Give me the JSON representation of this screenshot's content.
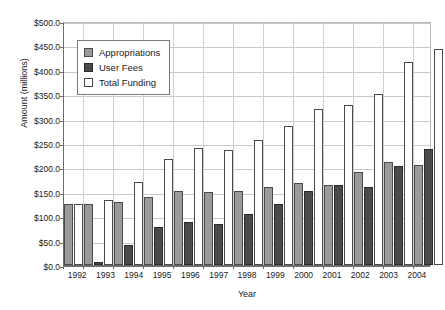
{
  "chart_data": {
    "type": "bar",
    "title": "",
    "xlabel": "Year",
    "ylabel": "Amount (millions)",
    "ylim": [
      0,
      500
    ],
    "ytick_values": [
      0,
      50,
      100,
      150,
      200,
      250,
      300,
      350,
      400,
      450,
      500
    ],
    "ytick_labels": [
      "$0.0",
      "$50.0",
      "$100.0",
      "$150.0",
      "$200.0",
      "$250.0",
      "$300.0",
      "$350.0",
      "$400.0",
      "$450.0",
      "$500.0"
    ],
    "grid": true,
    "legend_position": "upper left",
    "categories": [
      "1992",
      "1993",
      "1994",
      "1995",
      "1996",
      "1997",
      "1998",
      "1999",
      "2000",
      "2001",
      "2002",
      "2003",
      "2004"
    ],
    "series": [
      {
        "name": "Appropriations",
        "color": "#9a9a9a",
        "values": [
          126,
          126,
          130,
          140,
          152,
          150,
          152,
          160,
          168,
          163,
          190,
          212,
          205
        ]
      },
      {
        "name": "User Fees",
        "color": "#4a4a4a",
        "values": [
          0,
          7,
          40,
          78,
          88,
          85,
          105,
          125,
          151,
          163,
          160,
          203,
          237
        ]
      },
      {
        "name": "Total  Funding",
        "color": "#ffffff",
        "values": [
          126,
          133,
          170,
          218,
          239,
          235,
          256,
          285,
          319,
          327,
          350,
          415,
          442
        ]
      }
    ]
  }
}
